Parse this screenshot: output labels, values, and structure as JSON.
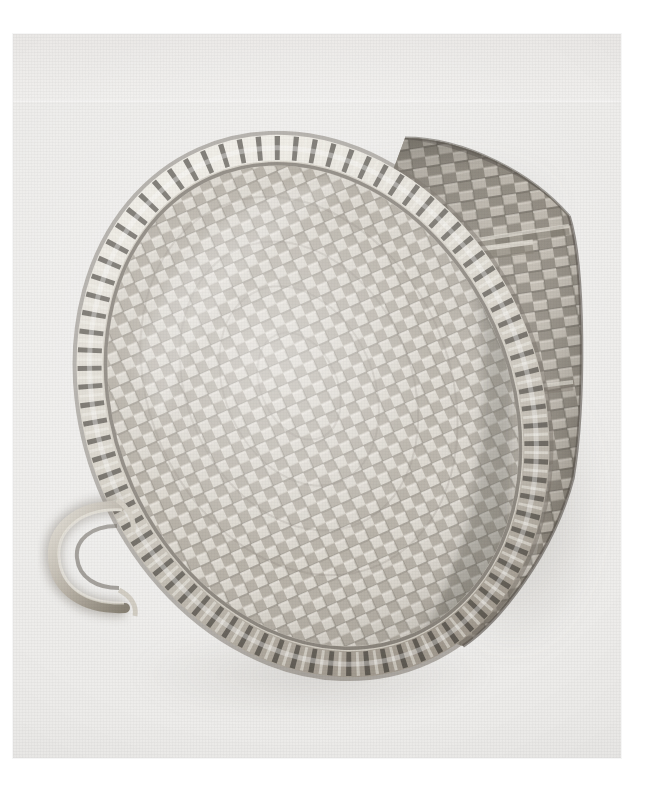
{
  "image": {
    "domain": "Natural-Image",
    "media": "black-and-white photograph",
    "subject_title": "Woven splint gathering basket",
    "orientation": "tilted three-quarter view, rim facing lower-left",
    "background_tone": "#efeeec",
    "print_edges": {
      "left": 13,
      "top": 34,
      "width": 608,
      "height": 724
    }
  },
  "palette": {
    "paper_white": "#ffffff",
    "print_ground": "#efeeec",
    "ground_shadow": "#e2e0dd",
    "splint_light": "#d9d5cd",
    "splint_mid": "#b4aea3",
    "splint_dark": "#8d857a",
    "splint_deep": "#6b6459",
    "weave_shadow": "#4c463d",
    "rim_light": "#e3e0d8",
    "rim_lash_dark": "#3a362f",
    "cast_shadow": "#cfccc6"
  },
  "subject": {
    "object_name": "basket",
    "construction": "plaited wood-splint basketry",
    "parts": [
      {
        "id": "rim",
        "label": "lashed oval rim hoop"
      },
      {
        "id": "rim-lashing",
        "label": "diagonal rim lashing stitches"
      },
      {
        "id": "interior",
        "label": "basket interior / plaited base field"
      },
      {
        "id": "body",
        "label": "tapering woven body"
      },
      {
        "id": "side-handle",
        "label": "bent loop side handle"
      },
      {
        "id": "ear-handle",
        "label": "carved ear handle at rim"
      },
      {
        "id": "shadow",
        "label": "cast shadow on backdrop"
      }
    ],
    "weave": {
      "pattern": "over-one under-one plain plait",
      "interior_rows": 34,
      "interior_cols": 26,
      "body_rows": 30,
      "body_cols": 18
    }
  },
  "geometry": {
    "rim_ellipse": {
      "cx": 300,
      "cy": 372,
      "rx": 216,
      "ry": 268,
      "rotate": -24
    },
    "body_quad": {
      "points": "395,110 560,178 566,440 470,600 330,560"
    },
    "side_handle": {
      "cx": 72,
      "cy": 520,
      "rx": 40,
      "ry": 46
    },
    "ear_handle": {
      "cx": 330,
      "cy": 262,
      "rx": 38,
      "ry": 66,
      "rotate": 14
    }
  }
}
